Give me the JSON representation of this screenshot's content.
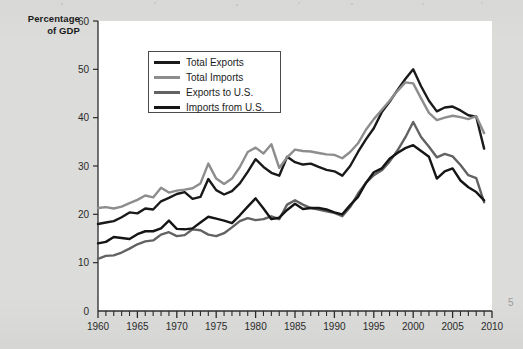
{
  "page": {
    "background_color": "#dcdcda",
    "plot_background_color": "#ffffff"
  },
  "axis_title": {
    "line1": "Percentage",
    "line2": "of GDP"
  },
  "legend": {
    "entries": [
      {
        "label": "Total Exports",
        "color": "#1a1a1a"
      },
      {
        "label": "Total Imports",
        "color": "#8d8d8d"
      },
      {
        "label": "Exports to U.S.",
        "color": "#626262"
      },
      {
        "label": "Imports from U.S.",
        "color": "#151515"
      }
    ]
  },
  "edge_artifact": "5",
  "chart_data": {
    "type": "line",
    "title": "",
    "xlabel": "",
    "ylabel": "Percentage of GDP",
    "xlim": [
      1960,
      2010
    ],
    "ylim": [
      0,
      60
    ],
    "yticks": [
      0,
      10,
      20,
      30,
      40,
      50,
      60
    ],
    "xticks": [
      1960,
      1965,
      1970,
      1975,
      1980,
      1985,
      1990,
      1995,
      2000,
      2005,
      2010
    ],
    "xminor_step": 1,
    "grid": false,
    "legend_position": "upper-left-inside",
    "x": [
      1960,
      1961,
      1962,
      1963,
      1964,
      1965,
      1966,
      1967,
      1968,
      1969,
      1970,
      1971,
      1972,
      1973,
      1974,
      1975,
      1976,
      1977,
      1978,
      1979,
      1980,
      1981,
      1982,
      1983,
      1984,
      1985,
      1986,
      1987,
      1988,
      1989,
      1990,
      1991,
      1992,
      1993,
      1994,
      1995,
      1996,
      1997,
      1998,
      1999,
      2000,
      2001,
      2002,
      2003,
      2004,
      2005,
      2006,
      2007,
      2008,
      2009
    ],
    "series": [
      {
        "name": "Total Exports",
        "color": "#1a1a1a",
        "width": 2.4,
        "values": [
          18.0,
          18.3,
          18.6,
          19.4,
          20.4,
          20.2,
          21.2,
          21.0,
          22.7,
          23.4,
          24.2,
          24.6,
          23.2,
          23.6,
          27.3,
          25.0,
          24.1,
          24.8,
          26.4,
          28.8,
          31.4,
          29.8,
          28.6,
          28.0,
          31.9,
          30.8,
          30.3,
          30.5,
          29.8,
          29.2,
          28.9,
          28.0,
          30.0,
          32.9,
          35.5,
          37.8,
          41.1,
          43.3,
          45.7,
          48.0,
          50.0,
          46.5,
          43.5,
          41.3,
          42.1,
          42.3,
          41.5,
          40.5,
          40.2,
          33.6
        ]
      },
      {
        "name": "Total Imports",
        "color": "#8d8d8d",
        "width": 2.4,
        "values": [
          21.3,
          21.5,
          21.2,
          21.6,
          22.3,
          23.0,
          23.9,
          23.5,
          25.5,
          24.5,
          24.9,
          25.1,
          25.4,
          26.4,
          30.5,
          27.4,
          26.3,
          27.4,
          29.8,
          32.9,
          33.8,
          32.6,
          34.5,
          29.6,
          31.8,
          33.4,
          33.1,
          33.0,
          32.7,
          32.4,
          32.3,
          31.6,
          32.9,
          34.7,
          37.5,
          39.7,
          41.6,
          43.5,
          45.5,
          47.3,
          47.1,
          44.0,
          41.0,
          39.5,
          40.0,
          40.4,
          40.1,
          39.7,
          40.3,
          36.8
        ]
      },
      {
        "name": "Exports to U.S.",
        "color": "#626262",
        "width": 2.4,
        "values": [
          10.8,
          11.4,
          11.5,
          12.1,
          12.9,
          13.8,
          14.4,
          14.6,
          15.8,
          16.3,
          15.5,
          15.7,
          16.9,
          16.7,
          15.8,
          15.5,
          16.1,
          17.3,
          18.6,
          19.2,
          18.8,
          19.0,
          19.6,
          19.0,
          22.0,
          22.9,
          22.0,
          21.3,
          21.0,
          20.6,
          20.3,
          19.6,
          21.5,
          24.3,
          26.5,
          28.1,
          29.1,
          30.9,
          33.2,
          35.9,
          39.1,
          36.0,
          34.0,
          31.8,
          32.5,
          32.0,
          30.2,
          28.1,
          27.5,
          22.5
        ]
      },
      {
        "name": "Imports from U.S.",
        "color": "#151515",
        "width": 2.4,
        "values": [
          14.0,
          14.3,
          15.3,
          15.1,
          14.9,
          15.9,
          16.5,
          16.5,
          17.1,
          18.7,
          17.0,
          16.9,
          17.1,
          18.3,
          19.5,
          19.1,
          18.7,
          18.2,
          19.8,
          21.6,
          23.3,
          21.2,
          19.0,
          19.3,
          20.9,
          22.2,
          21.1,
          21.3,
          21.3,
          21.0,
          20.4,
          20.0,
          21.9,
          23.6,
          26.5,
          28.7,
          29.5,
          31.5,
          32.7,
          33.7,
          34.3,
          33.1,
          31.9,
          27.4,
          28.9,
          29.5,
          27.0,
          25.6,
          24.6,
          22.9
        ]
      }
    ]
  }
}
